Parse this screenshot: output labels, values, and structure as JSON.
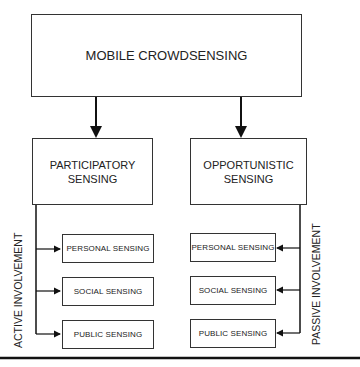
{
  "diagram": {
    "root": {
      "label": "MOBILE CROWDSENSING"
    },
    "branches": [
      {
        "label": "PARTICIPATORY\nSENSING",
        "side_label": "ACTIVE INVOLVEMENT",
        "children": [
          "PERSONAL SENSING",
          "SOCIAL SENSING",
          "PUBLIC SENSING"
        ]
      },
      {
        "label": "OPPORTUNISTIC\nSENSING",
        "side_label": "PASSIVE INVOLVEMENT",
        "children": [
          "PERSONAL SENSING",
          "SOCIAL SENSING",
          "PUBLIC SENSING"
        ]
      }
    ],
    "colors": {
      "line": "#111111",
      "border": "#333333",
      "background": "#ffffff"
    }
  }
}
